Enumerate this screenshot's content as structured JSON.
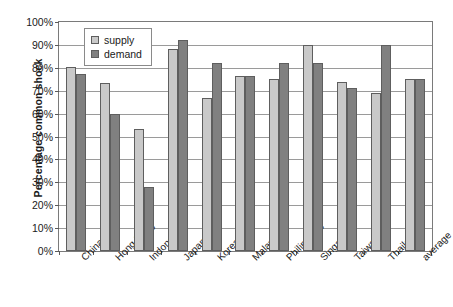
{
  "chart_data": {
    "type": "bar",
    "title": "",
    "xlabel": "",
    "ylabel": "Percentage common shock",
    "ylim": [
      0,
      100
    ],
    "yunit": "%",
    "ytick_labels": [
      "100%",
      "90%",
      "80%",
      "70%",
      "60%",
      "50%",
      "40%",
      "30%",
      "20%",
      "10%",
      "0%"
    ],
    "ytick_values": [
      100,
      90,
      80,
      70,
      60,
      50,
      40,
      30,
      20,
      10,
      0
    ],
    "grid": "horizontal",
    "legend_position": "inside-top-left",
    "categories": [
      "China",
      "Hong Kong",
      "Indonesia",
      "Japan",
      "Korea",
      "Malaysia",
      "Philippines",
      "Singapore",
      "Taiwan",
      "Thailand",
      "average"
    ],
    "series": [
      {
        "name": "supply",
        "color": "#c9c9c9",
        "values": [
          80.5,
          73.5,
          53.5,
          88,
          67,
          76.5,
          75,
          90,
          74,
          69,
          75
        ]
      },
      {
        "name": "demand",
        "color": "#808080",
        "values": [
          77.5,
          60,
          28,
          92,
          82,
          76.5,
          82,
          82,
          71,
          90,
          75
        ]
      }
    ]
  }
}
